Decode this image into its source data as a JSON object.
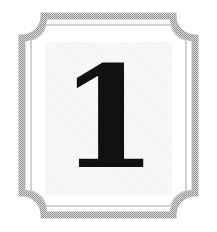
{
  "card": {
    "numeral": "1",
    "colors": {
      "frame": "#a9a9a9",
      "inner_line": "#c4c4c4",
      "panel": "#f4f4f4",
      "numeral": "#111111",
      "background": "#ffffff"
    }
  }
}
